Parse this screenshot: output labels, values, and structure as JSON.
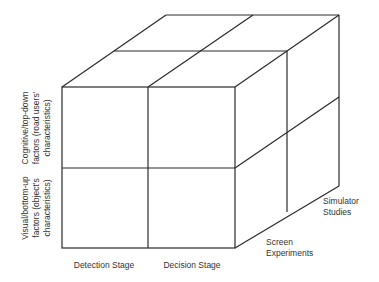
{
  "diagram": {
    "type": "3d-cube-matrix",
    "x_axis": {
      "labels": [
        "Detection Stage",
        "Decision Stage"
      ]
    },
    "y_axis": {
      "labels": [
        [
          "Cognitive/top-down",
          "factors (road users'",
          "characteristics)"
        ],
        [
          "Visual/bottom-up",
          "factors (object's",
          "characteristics)"
        ]
      ]
    },
    "z_axis": {
      "labels": [
        [
          "Screen",
          "Experiments"
        ],
        [
          "Simulator",
          "Studies"
        ]
      ]
    },
    "colors": {
      "line": "#2a2a2a",
      "text": "#333333",
      "background": "#ffffff"
    }
  }
}
